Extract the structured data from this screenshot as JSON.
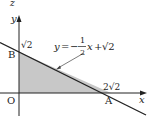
{
  "figure": {
    "type": "coordinate-diagram",
    "top_label": "z",
    "axes": {
      "x_label": "x",
      "y_label": "y",
      "origin_label": "O"
    },
    "points": {
      "B": {
        "label": "B",
        "value_label": "√2"
      },
      "A": {
        "label": "A",
        "value_label": "2√2"
      }
    },
    "line": {
      "equation_parts": {
        "lhs": "y",
        "eq": "=",
        "minus": "−",
        "num": "1",
        "den": "2",
        "var": "x",
        "plus": "+",
        "const": "√2"
      }
    },
    "colors": {
      "shade": "#c8c8c8",
      "ink": "#222222"
    }
  }
}
